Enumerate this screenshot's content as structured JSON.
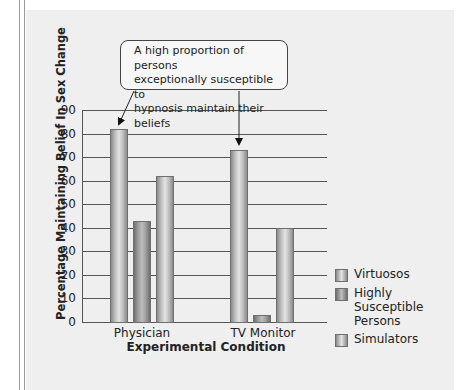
{
  "chart_data": {
    "type": "bar",
    "title": "",
    "xlabel": "Experimental Condition",
    "ylabel": "Percentage Maintaining Belief In Sex Change",
    "categories": [
      "Physician",
      "TV Monitor"
    ],
    "series": [
      {
        "name": "Virtuosos",
        "values": [
          82,
          73
        ]
      },
      {
        "name": "Highly Susceptible Persons",
        "values": [
          43,
          3
        ]
      },
      {
        "name": "Simulators",
        "values": [
          62,
          40
        ]
      }
    ],
    "ylim": [
      0,
      90
    ],
    "yticks": [
      0,
      10,
      20,
      30,
      40,
      50,
      60,
      70,
      80,
      90
    ],
    "grid": true,
    "legend_position": "right-bottom",
    "annotations": [
      {
        "text": "A high proportion of persons exceptionally susceptible to hypnosis maintain their beliefs",
        "points_to": [
          "Physician / Virtuosos",
          "TV Monitor / Virtuosos"
        ]
      }
    ]
  },
  "axis": {
    "ylabel": "Percentage Maintaining Belief In Sex Change",
    "xlabel": "Experimental Condition",
    "yticks": [
      "0",
      "10",
      "20",
      "30",
      "40",
      "50",
      "60",
      "70",
      "80",
      "90"
    ],
    "categories": [
      "Physician",
      "TV Monitor"
    ]
  },
  "callout": {
    "line1": "A high proportion of persons",
    "line2": "exceptionally susceptible to",
    "line3": "hypnosis maintain their beliefs"
  },
  "legend": {
    "items": [
      {
        "label": "Virtuosos"
      },
      {
        "label": "Highly Susceptible Persons"
      },
      {
        "label": "Simulators"
      }
    ]
  },
  "colors": {
    "panel_bg": "#efefef",
    "bar_light": "#e4e4e4",
    "bar_dark": "#8a8a8a",
    "grid": "#555555"
  }
}
